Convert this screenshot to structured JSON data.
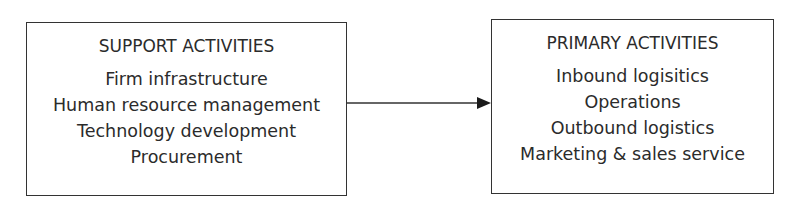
{
  "diagram": {
    "type": "flow",
    "nodes": [
      {
        "id": "support",
        "title": "SUPPORT ACTIVITIES",
        "items": [
          "Firm infrastructure",
          "Human resource management",
          "Technology development",
          "Procurement"
        ]
      },
      {
        "id": "primary",
        "title": "PRIMARY ACTIVITIES",
        "items": [
          "Inbound logisitics",
          "Operations",
          "Outbound logistics",
          "Marketing & sales service"
        ]
      }
    ],
    "edges": [
      {
        "from": "support",
        "to": "primary",
        "style": "solid",
        "arrowhead": "filled-triangle"
      }
    ],
    "colors": {
      "stroke": "#333333",
      "text": "#2b2b2b",
      "background": "#ffffff"
    }
  }
}
